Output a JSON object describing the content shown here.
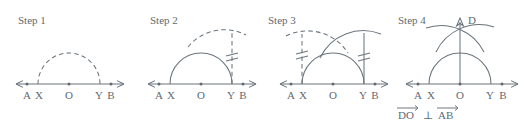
{
  "figure": {
    "stroke_color": "#6b757e",
    "label_color": "#5f6a73",
    "background": "#ffffff",
    "width": 527,
    "height": 127
  },
  "steps": [
    {
      "label": "Step 1",
      "axis_labels": [
        "A",
        "X",
        "O",
        "Y",
        "B"
      ],
      "arc_style": "dashed",
      "description": "Dashed semicircle drawn from X to Y centered at O"
    },
    {
      "label": "Step 2",
      "axis_labels": [
        "A",
        "X",
        "O",
        "Y",
        "B"
      ],
      "arc_style": "solid-with-dashed-arc",
      "tick_marks": 2,
      "description": "Solid semicircle X to Y; dashed arc swung from Y; dashed vertical at Y with double tick marks"
    },
    {
      "label": "Step 3",
      "axis_labels": [
        "A",
        "X",
        "O",
        "Y",
        "B"
      ],
      "arc_style": "crossing-arcs",
      "tick_marks": 2,
      "description": "Arcs from X and Y intersect above; congruence ticks on both verticals"
    },
    {
      "label": "Step 4",
      "axis_labels": [
        "A",
        "X",
        "O",
        "Y",
        "B"
      ],
      "apex_label": "D",
      "arc_style": "final",
      "description": "Ray from O through arc intersection to D, perpendicular to AB"
    }
  ],
  "conclusion": {
    "text": "DO ⊥ AB",
    "segment_1": "DO",
    "relation": "⊥",
    "segment_2": "AB"
  }
}
